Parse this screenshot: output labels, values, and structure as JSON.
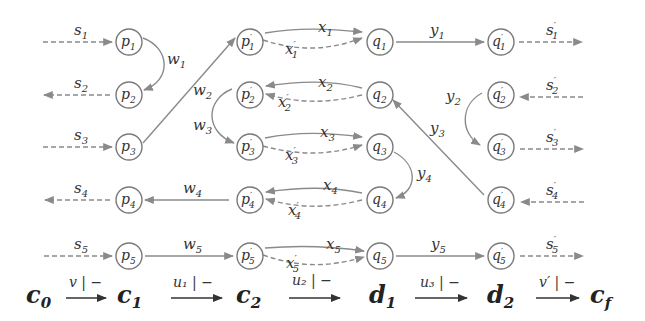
{
  "colors": {
    "edge": "#8a8a8a",
    "node_stroke": "#7a7a7a",
    "text": "#333333",
    "background": "#ffffff"
  },
  "nodes": [
    {
      "id": "p1",
      "label": "p",
      "sub": "1",
      "prime": false,
      "x": 129,
      "y": 42
    },
    {
      "id": "p2",
      "label": "p",
      "sub": "2",
      "prime": false,
      "x": 129,
      "y": 95
    },
    {
      "id": "p3",
      "label": "p",
      "sub": "3",
      "prime": false,
      "x": 129,
      "y": 147
    },
    {
      "id": "p4",
      "label": "p",
      "sub": "4",
      "prime": false,
      "x": 129,
      "y": 200
    },
    {
      "id": "p5",
      "label": "p",
      "sub": "5",
      "prime": false,
      "x": 129,
      "y": 256
    },
    {
      "id": "pp1",
      "label": "p",
      "sub": "1",
      "prime": true,
      "x": 250,
      "y": 42
    },
    {
      "id": "pp2",
      "label": "p",
      "sub": "2",
      "prime": true,
      "x": 250,
      "y": 95
    },
    {
      "id": "pp3",
      "label": "p",
      "sub": "3",
      "prime": true,
      "x": 250,
      "y": 147
    },
    {
      "id": "pp4",
      "label": "p",
      "sub": "4",
      "prime": true,
      "x": 250,
      "y": 200
    },
    {
      "id": "pp5",
      "label": "p",
      "sub": "5",
      "prime": true,
      "x": 250,
      "y": 256
    },
    {
      "id": "q1",
      "label": "q",
      "sub": "1",
      "prime": false,
      "x": 380,
      "y": 42
    },
    {
      "id": "q2",
      "label": "q",
      "sub": "2",
      "prime": false,
      "x": 380,
      "y": 95
    },
    {
      "id": "q3",
      "label": "q",
      "sub": "3",
      "prime": false,
      "x": 380,
      "y": 147
    },
    {
      "id": "q4",
      "label": "q",
      "sub": "4",
      "prime": false,
      "x": 380,
      "y": 200
    },
    {
      "id": "q5",
      "label": "q",
      "sub": "5",
      "prime": false,
      "x": 380,
      "y": 256
    },
    {
      "id": "qp1",
      "label": "q",
      "sub": "1",
      "prime": true,
      "x": 501,
      "y": 42
    },
    {
      "id": "qp2",
      "label": "q",
      "sub": "2",
      "prime": true,
      "x": 501,
      "y": 95
    },
    {
      "id": "qp3",
      "label": "q",
      "sub": "3",
      "prime": true,
      "x": 501,
      "y": 147
    },
    {
      "id": "qp4",
      "label": "q",
      "sub": "4",
      "prime": true,
      "x": 501,
      "y": 200
    },
    {
      "id": "qp5",
      "label": "q",
      "sub": "5",
      "prime": true,
      "x": 501,
      "y": 256
    }
  ],
  "edge_labels": {
    "s1": {
      "base": "s",
      "sub": "1",
      "prime": ""
    },
    "s2": {
      "base": "s",
      "sub": "2",
      "prime": ""
    },
    "s3": {
      "base": "s",
      "sub": "3",
      "prime": ""
    },
    "s4": {
      "base": "s",
      "sub": "4",
      "prime": ""
    },
    "s5": {
      "base": "s",
      "sub": "5",
      "prime": ""
    },
    "w1": {
      "base": "w",
      "sub": "1",
      "prime": ""
    },
    "w2": {
      "base": "w",
      "sub": "2",
      "prime": ""
    },
    "w3": {
      "base": "w",
      "sub": "3",
      "prime": ""
    },
    "w4": {
      "base": "w",
      "sub": "4",
      "prime": ""
    },
    "w5": {
      "base": "w",
      "sub": "5",
      "prime": ""
    },
    "x1": {
      "base": "x",
      "sub": "1",
      "prime": ""
    },
    "x2": {
      "base": "x",
      "sub": "2",
      "prime": ""
    },
    "x3": {
      "base": "x",
      "sub": "3",
      "prime": ""
    },
    "x4": {
      "base": "x",
      "sub": "4",
      "prime": ""
    },
    "x5": {
      "base": "x",
      "sub": "5",
      "prime": ""
    },
    "xp1": {
      "base": "x",
      "sub": "1",
      "prime": "′"
    },
    "xp2": {
      "base": "x",
      "sub": "2",
      "prime": "′"
    },
    "xp3": {
      "base": "x",
      "sub": "3",
      "prime": "′"
    },
    "xp4": {
      "base": "x",
      "sub": "4",
      "prime": "′"
    },
    "xp5": {
      "base": "x",
      "sub": "5",
      "prime": "′"
    },
    "y1": {
      "base": "y",
      "sub": "1",
      "prime": ""
    },
    "y2": {
      "base": "y",
      "sub": "2",
      "prime": ""
    },
    "y3": {
      "base": "y",
      "sub": "3",
      "prime": ""
    },
    "y4": {
      "base": "y",
      "sub": "4",
      "prime": ""
    },
    "y5": {
      "base": "y",
      "sub": "5",
      "prime": ""
    },
    "sp1": {
      "base": "s",
      "sub": "1",
      "prime": "′"
    },
    "sp2": {
      "base": "s",
      "sub": "2",
      "prime": "′"
    },
    "sp3": {
      "base": "s",
      "sub": "3",
      "prime": "′"
    },
    "sp4": {
      "base": "s",
      "sub": "4",
      "prime": "′"
    },
    "sp5": {
      "base": "s",
      "sub": "5",
      "prime": "′"
    }
  },
  "edges": [
    {
      "label": "s1",
      "from": "in",
      "to": "p1",
      "style": "dashed",
      "direction": "right"
    },
    {
      "label": "s2",
      "from": "p2",
      "to": "out",
      "style": "dashed",
      "direction": "left"
    },
    {
      "label": "s3",
      "from": "in",
      "to": "p3",
      "style": "dashed",
      "direction": "right"
    },
    {
      "label": "s4",
      "from": "p4",
      "to": "out",
      "style": "dashed",
      "direction": "left"
    },
    {
      "label": "s5",
      "from": "in",
      "to": "p5",
      "style": "dashed",
      "direction": "right"
    },
    {
      "label": "w1",
      "from": "p1",
      "to": "p2",
      "style": "solid"
    },
    {
      "label": "w2",
      "from": "p3",
      "to": "pp1",
      "style": "solid"
    },
    {
      "label": "w3",
      "from": "pp2",
      "to": "pp3",
      "style": "solid"
    },
    {
      "label": "w4",
      "from": "pp4",
      "to": "p4",
      "style": "solid"
    },
    {
      "label": "w5",
      "from": "p5",
      "to": "pp5",
      "style": "solid"
    },
    {
      "label": "x1",
      "from": "pp1",
      "to": "q1",
      "style": "solid"
    },
    {
      "label": "xp1",
      "from": "pp1",
      "to": "q1",
      "style": "dashed"
    },
    {
      "label": "x2",
      "from": "q2",
      "to": "pp2",
      "style": "solid"
    },
    {
      "label": "xp2",
      "from": "q2",
      "to": "pp2",
      "style": "dashed"
    },
    {
      "label": "x3",
      "from": "pp3",
      "to": "q3",
      "style": "solid"
    },
    {
      "label": "xp3",
      "from": "pp3",
      "to": "q3",
      "style": "dashed"
    },
    {
      "label": "x4",
      "from": "q4",
      "to": "pp4",
      "style": "solid"
    },
    {
      "label": "xp4",
      "from": "q4",
      "to": "pp4",
      "style": "dashed"
    },
    {
      "label": "x5",
      "from": "pp5",
      "to": "q5",
      "style": "solid"
    },
    {
      "label": "xp5",
      "from": "pp5",
      "to": "q5",
      "style": "dashed"
    },
    {
      "label": "y1",
      "from": "q1",
      "to": "qp1",
      "style": "solid"
    },
    {
      "label": "y2",
      "from": "qp2",
      "to": "qp3",
      "style": "solid"
    },
    {
      "label": "y3",
      "from": "qp4",
      "to": "q2",
      "style": "solid"
    },
    {
      "label": "y4",
      "from": "q3",
      "to": "q4",
      "style": "solid"
    },
    {
      "label": "y5",
      "from": "q5",
      "to": "qp5",
      "style": "solid"
    },
    {
      "label": "sp1",
      "from": "qp1",
      "to": "out",
      "style": "dashed",
      "direction": "right"
    },
    {
      "label": "sp2",
      "from": "in",
      "to": "qp2",
      "style": "dashed",
      "direction": "left"
    },
    {
      "label": "sp3",
      "from": "qp3",
      "to": "out",
      "style": "dashed",
      "direction": "right"
    },
    {
      "label": "sp4",
      "from": "in",
      "to": "qp4",
      "style": "dashed",
      "direction": "left"
    },
    {
      "label": "sp5",
      "from": "qp5",
      "to": "out",
      "style": "dashed",
      "direction": "right"
    }
  ],
  "sequence": {
    "states": [
      {
        "id": "c0",
        "base": "c",
        "sub": "0"
      },
      {
        "id": "c1",
        "base": "c",
        "sub": "1"
      },
      {
        "id": "c2",
        "base": "c",
        "sub": "2"
      },
      {
        "id": "d1",
        "base": "d",
        "sub": "1"
      },
      {
        "id": "d2",
        "base": "d",
        "sub": "2"
      },
      {
        "id": "cf",
        "base": "c",
        "sub": "f"
      }
    ],
    "transitions": [
      {
        "from": "c0",
        "to": "c1",
        "label": "v | −"
      },
      {
        "from": "c1",
        "to": "c2",
        "label": "u₁ | −"
      },
      {
        "from": "c2",
        "to": "d1",
        "label": "u₂ | −"
      },
      {
        "from": "d1",
        "to": "d2",
        "label": "u₃ | −"
      },
      {
        "from": "d2",
        "to": "cf",
        "label": "v′ | −"
      }
    ]
  }
}
